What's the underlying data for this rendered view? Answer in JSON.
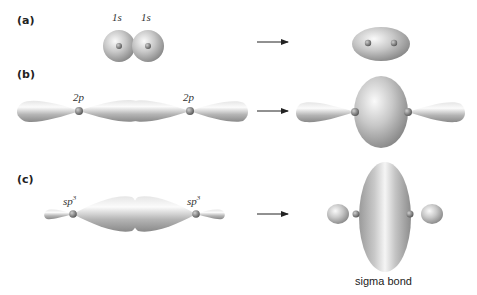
{
  "panels": [
    {
      "id": "a",
      "label": "(a)",
      "orbital_labels": [
        "1s",
        "1s"
      ],
      "orbital_base": "s",
      "orbital_prefix": "1"
    },
    {
      "id": "b",
      "label": "(b)",
      "orbital_labels": [
        "2p",
        "2p"
      ]
    },
    {
      "id": "c",
      "label": "(c)",
      "orbital_labels": [
        "sp3",
        "sp3"
      ],
      "base": "sp",
      "sup": "3"
    }
  ],
  "caption": "sigma bond",
  "colors": {
    "orbital_light": "#f2f2f2",
    "orbital_mid": "#b8b8b8",
    "orbital_dark": "#7a7a7a",
    "nucleus": "#6e6e6e",
    "arrow": "#222222"
  }
}
